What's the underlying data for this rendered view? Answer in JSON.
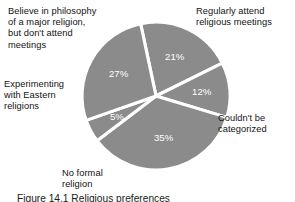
{
  "figure": {
    "caption": "Figure 14.1   Religious preferences",
    "background_color": "#ffffff",
    "slice_color": "#8b8b8b",
    "separator_color": "#ffffff",
    "value_label_color": "#ffffff",
    "label_color": "#131313"
  },
  "chart_data": {
    "type": "pie",
    "title": "",
    "xlabel": "",
    "ylabel": "",
    "legend": "none",
    "grid": false,
    "units": "percent",
    "total": 100,
    "categories": [
      "Regularly attend religious meetings",
      "Couldn't be categorized",
      "No formal religion",
      "Experimenting with Eastern religions",
      "Believe in philosophy of a major religion, but don't attend meetings"
    ],
    "values": [
      21,
      12,
      35,
      5,
      27
    ],
    "value_labels": [
      "21%",
      "12%",
      "35%",
      "5%",
      "27%"
    ],
    "slices": [
      {
        "label": "Regularly attend religious meetings",
        "label_text": "Regularly attend\nreligious meetings",
        "value": 21,
        "value_label": "21%",
        "start_angle": -12,
        "end_angle": 63.6,
        "color": "#8b8b8b"
      },
      {
        "label": "Couldn't be categorized",
        "label_text": "Couldn't be\ncategorized",
        "value": 12,
        "value_label": "12%",
        "start_angle": 63.6,
        "end_angle": 106.8,
        "color": "#8b8b8b"
      },
      {
        "label": "No formal religion",
        "label_text": "No formal\nreligion",
        "value": 35,
        "value_label": "35%",
        "start_angle": 106.8,
        "end_angle": 232.8,
        "color": "#8b8b8b"
      },
      {
        "label": "Experimenting with Eastern religions",
        "label_text": "Experimenting\nwith Eastern\nreligions",
        "value": 5,
        "value_label": "5%",
        "start_angle": 232.8,
        "end_angle": 250.8,
        "color": "#8b8b8b"
      },
      {
        "label": "Believe in philosophy of a major religion, but don't attend meetings",
        "label_text": "Believe in philosophy\nof a major religion,\nbut don't attend\nmeetings",
        "value": 27,
        "value_label": "27%",
        "start_angle": 250.8,
        "end_angle": 348,
        "color": "#8b8b8b"
      }
    ]
  }
}
